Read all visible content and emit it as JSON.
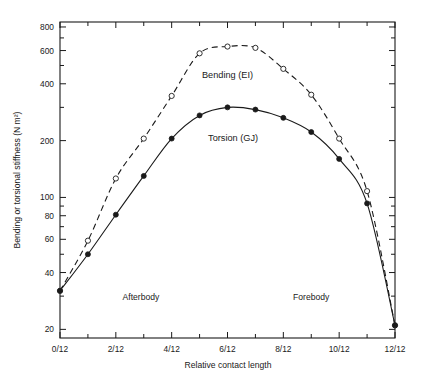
{
  "chart_data": {
    "type": "line",
    "title": "",
    "xlabel": "Relative contact length",
    "ylabel": "Bending or torsional stiffness (N m²)",
    "yscale": "log",
    "ylim": [
      18,
      850
    ],
    "xlim": [
      0,
      12
    ],
    "grid": false,
    "legend_position": "inline-annotation",
    "y_ticks": [
      20,
      40,
      60,
      80,
      100,
      200,
      400,
      600,
      800
    ],
    "y_tick_labels": [
      "20",
      "40",
      "60",
      "80",
      "100",
      "200",
      "400",
      "600",
      "800"
    ],
    "y_minor_ticks": [
      30,
      50,
      70,
      90,
      300,
      500,
      700
    ],
    "x_ticks": [
      0,
      1,
      2,
      3,
      4,
      5,
      6,
      7,
      8,
      9,
      10,
      11,
      12
    ],
    "x_tick_labels": [
      "0/12",
      "",
      "2/12",
      "",
      "4/12",
      "",
      "6/12",
      "",
      "8/12",
      "",
      "10/12",
      "",
      "12/12"
    ],
    "x_major_ticks": [
      0,
      2,
      4,
      6,
      8,
      10,
      12
    ],
    "x": [
      0,
      1,
      2,
      3,
      4,
      5,
      6,
      7,
      8,
      9,
      10,
      11,
      12
    ],
    "series": [
      {
        "name": "Bending (EI)",
        "marker": "open-circle",
        "line": "dashed",
        "label_x": 6.0,
        "label_y": 430,
        "values": [
          32,
          59,
          126,
          205,
          345,
          580,
          630,
          620,
          480,
          350,
          205,
          108,
          21
        ]
      },
      {
        "name": "Torsion (GJ)",
        "marker": "filled-circle",
        "line": "solid",
        "label_x": 6.2,
        "label_y": 200,
        "values": [
          32,
          50,
          81,
          130,
          205,
          272,
          300,
          292,
          264,
          222,
          160,
          93,
          21
        ]
      }
    ],
    "annotations": [
      {
        "text": "Afterbody",
        "x": 2.9,
        "y": 28.5
      },
      {
        "text": "Forebody",
        "x": 9.0,
        "y": 28.5
      }
    ]
  },
  "axes": {
    "ylabel": "Bending or torsional stiffness (N m²)",
    "xlabel": "Relative contact length"
  },
  "colors": {
    "ink": "#1a1a1a",
    "background": "#ffffff"
  }
}
